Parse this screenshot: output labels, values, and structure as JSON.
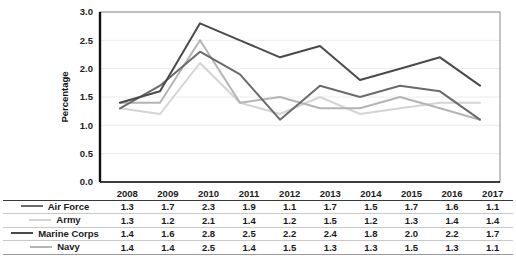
{
  "chart_data": {
    "type": "line",
    "title": "",
    "subtitle": "",
    "xlabel": "",
    "ylabel": "Percentage",
    "categories": [
      "2008",
      "2009",
      "2010",
      "2011",
      "2012",
      "2013",
      "2014",
      "2015",
      "2016",
      "2017"
    ],
    "ylim": [
      0.0,
      3.0
    ],
    "ytick_labels": [
      "0.0",
      "0.5",
      "1.0",
      "1.5",
      "2.0",
      "2.5",
      "3.0"
    ],
    "ytick_values": [
      0.0,
      0.5,
      1.0,
      1.5,
      2.0,
      2.5,
      3.0
    ],
    "grid": true,
    "grid_axis": "y",
    "legend_position": "below-left",
    "markers": false,
    "series": [
      {
        "name": "Air Force",
        "color": "#6b6b6b",
        "values": [
          1.3,
          1.7,
          2.3,
          1.9,
          1.1,
          1.7,
          1.5,
          1.7,
          1.6,
          1.1
        ]
      },
      {
        "name": "Army",
        "color": "#d4d4d4",
        "values": [
          1.3,
          1.2,
          2.1,
          1.4,
          1.2,
          1.5,
          1.2,
          1.3,
          1.4,
          1.4
        ]
      },
      {
        "name": "Marine Corps",
        "color": "#4a4a4a",
        "values": [
          1.4,
          1.6,
          2.8,
          2.5,
          2.2,
          2.4,
          1.8,
          2.0,
          2.2,
          1.7
        ]
      },
      {
        "name": "Navy",
        "color": "#b4b4b4",
        "values": [
          1.4,
          1.4,
          2.5,
          1.4,
          1.5,
          1.3,
          1.3,
          1.5,
          1.3,
          1.1
        ]
      }
    ]
  },
  "table": {
    "corner_header": "",
    "column_headers": [
      "2008",
      "2009",
      "2010",
      "2011",
      "2012",
      "2013",
      "2014",
      "2015",
      "2016",
      "2017"
    ],
    "rows": [
      {
        "label": "Air Force",
        "swatch_color": "#6b6b6b",
        "values": [
          "1.3",
          "1.7",
          "2.3",
          "1.9",
          "1.1",
          "1.7",
          "1.5",
          "1.7",
          "1.6",
          "1.1"
        ]
      },
      {
        "label": "Army",
        "swatch_color": "#d4d4d4",
        "values": [
          "1.3",
          "1.2",
          "2.1",
          "1.4",
          "1.2",
          "1.5",
          "1.2",
          "1.3",
          "1.4",
          "1.4"
        ]
      },
      {
        "label": "Marine Corps",
        "swatch_color": "#4a4a4a",
        "values": [
          "1.4",
          "1.6",
          "2.8",
          "2.5",
          "2.2",
          "2.4",
          "1.8",
          "2.0",
          "2.2",
          "1.7"
        ]
      },
      {
        "label": "Navy",
        "swatch_color": "#b4b4b4",
        "values": [
          "1.4",
          "1.4",
          "2.5",
          "1.4",
          "1.5",
          "1.3",
          "1.3",
          "1.5",
          "1.3",
          "1.1"
        ]
      }
    ]
  },
  "style": {
    "plot_border_color": "#8a8a8a",
    "axis_color": "#111111",
    "gridline_color": "#ececec",
    "background": "#ffffff"
  }
}
